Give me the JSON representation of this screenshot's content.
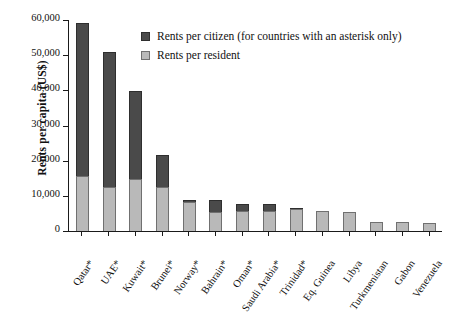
{
  "chart_data": {
    "type": "bar",
    "subtype": "stacked-bar",
    "title": "",
    "xlabel": "",
    "ylabel": "Rents per capita (US$)",
    "ylim": [
      0,
      60000
    ],
    "yticks": [
      "0",
      "10,000",
      "20,000",
      "30,000",
      "40,000",
      "50,000",
      "60,000"
    ],
    "ytick_values": [
      0,
      10000,
      20000,
      30000,
      40000,
      50000,
      60000
    ],
    "grid": false,
    "legend_position": "top-center",
    "legend": [
      "Rents per citizen (for countries with an asterisk only)",
      "Rents per resident"
    ],
    "categories": [
      "Qatar*",
      "UAE*",
      "Kuwait*",
      "Brunei*",
      "Norway*",
      "Bahrain*",
      "Oman*",
      "Saudi Arabia*",
      "Trinidad*",
      "Eq. Guinea",
      "Libya",
      "Turkmenistan",
      "Gabon",
      "Venezuela"
    ],
    "series": [
      {
        "name": "Rents per resident",
        "color": "#b9b9b9",
        "values": [
          15600,
          12600,
          14900,
          12500,
          8300,
          5500,
          5600,
          5600,
          6300,
          5700,
          5500,
          2700,
          2700,
          2400
        ]
      },
      {
        "name": "Rents per citizen (for countries with an asterisk only)",
        "color": "#4a4a4a",
        "values": [
          59100,
          50900,
          39700,
          21600,
          8700,
          8700,
          7800,
          7800,
          6400,
          0,
          0,
          0,
          0,
          0
        ]
      }
    ]
  },
  "colors": {
    "dark": "#4a4a4a",
    "light": "#b9b9b9",
    "axis": "#1a1a1a",
    "background": "#ffffff"
  }
}
